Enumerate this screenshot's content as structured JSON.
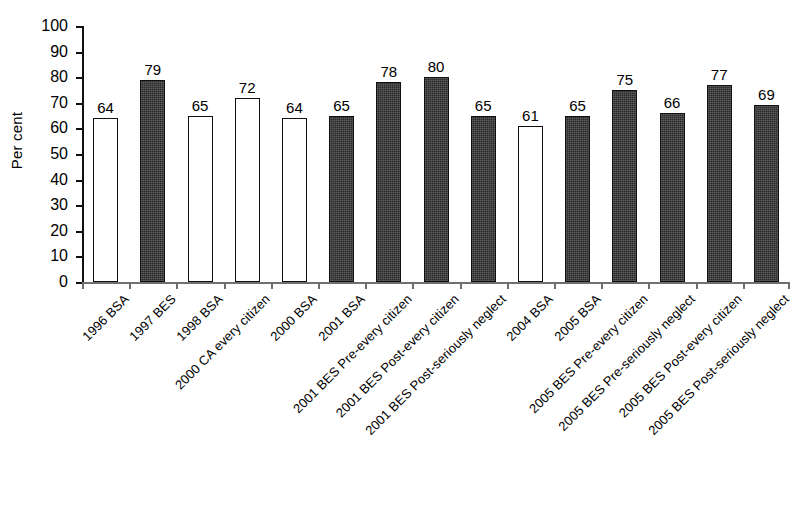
{
  "chart_data": {
    "type": "bar",
    "title": "",
    "xlabel": "",
    "ylabel": "Per cent",
    "ylim": [
      0,
      100
    ],
    "ytick_step": 10,
    "yticks": [
      100,
      90,
      80,
      70,
      60,
      50,
      40,
      30,
      20,
      10,
      0
    ],
    "grid": false,
    "legend": "none",
    "categories": [
      "1996 BSA",
      "1997 BES",
      "1998 BSA",
      "2000 CA every citizen",
      "2000 BSA",
      "2001 BSA",
      "2001 BES Pre-every citizen",
      "2001 BES Post-every citizen",
      "2001 BES Post-seriously neglect",
      "2004 BSA",
      "2005 BSA",
      "2005 BES Pre-every citizen",
      "2005 BES Pre-seriously neglect",
      "2005 BES Post-every citizen",
      "2005 BES Post-seriously neglect"
    ],
    "values": [
      64,
      79,
      65,
      72,
      64,
      65,
      78,
      80,
      65,
      61,
      65,
      75,
      66,
      77,
      69
    ],
    "bar_styles": [
      "open",
      "filled",
      "open",
      "open",
      "open",
      "filled",
      "filled",
      "filled",
      "filled",
      "open",
      "filled",
      "filled",
      "filled",
      "filled",
      "filled"
    ]
  },
  "colors": {
    "filled_bar": "#2b2b2b",
    "open_bar": "#ffffff",
    "outline": "#111111",
    "axis": "#6f6f6f",
    "text": "#000000"
  }
}
